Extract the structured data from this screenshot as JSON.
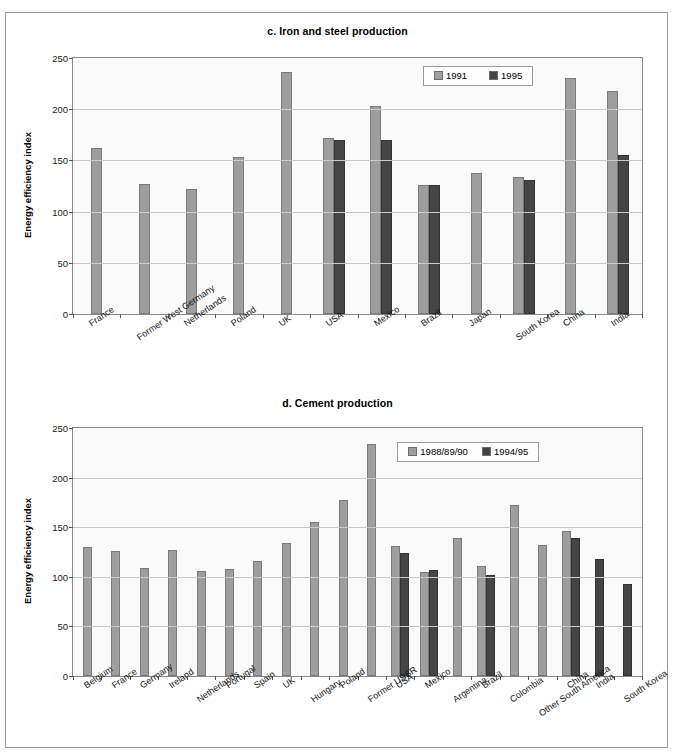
{
  "figure": {
    "axis_label": "Energy efficiency index",
    "yticks": [
      0,
      50,
      100,
      150,
      200,
      250
    ]
  },
  "chart_data": [
    {
      "id": "c",
      "type": "bar",
      "title": "c. Iron and steel production",
      "xlabel": "",
      "ylabel": "Energy efficiency index",
      "ylim": [
        0,
        250
      ],
      "grid": true,
      "legend_position": "upper-right-inside",
      "categories": [
        "France",
        "Former West Germany",
        "Netherlands",
        "Poland",
        "UK",
        "USA",
        "Mexico",
        "Brazil",
        "Japan",
        "South Korea",
        "China",
        "India"
      ],
      "series": [
        {
          "name": "1991",
          "color": "#9e9e9e",
          "values": [
            162,
            127,
            122,
            153,
            236,
            172,
            203,
            126,
            138,
            134,
            230,
            218
          ]
        },
        {
          "name": "1995",
          "color": "#454545",
          "values": [
            null,
            null,
            null,
            null,
            null,
            170,
            170,
            126,
            null,
            131,
            null,
            155
          ]
        }
      ]
    },
    {
      "id": "d",
      "type": "bar",
      "title": "d. Cement production",
      "xlabel": "",
      "ylabel": "Energy efficiency index",
      "ylim": [
        0,
        250
      ],
      "grid": true,
      "legend_position": "upper-center-inside",
      "categories": [
        "Belgium",
        "France",
        "Germany",
        "Ireland",
        "Netherlands",
        "Portugal",
        "Spain",
        "UK",
        "Hungary",
        "Poland",
        "Former USSR",
        "USA",
        "Mexico",
        "Argentina",
        "Brazil",
        "Colombia",
        "Other South America",
        "China",
        "India",
        "South Korea"
      ],
      "series": [
        {
          "name": "1988/89/90",
          "color": "#9e9e9e",
          "values": [
            130,
            126,
            109,
            127,
            106,
            108,
            116,
            134,
            155,
            177,
            234,
            131,
            105,
            139,
            111,
            172,
            132,
            146,
            null,
            null
          ]
        },
        {
          "name": "1994/95",
          "color": "#454545",
          "values": [
            null,
            null,
            null,
            null,
            null,
            null,
            null,
            null,
            null,
            null,
            null,
            124,
            107,
            null,
            102,
            null,
            null,
            139,
            118,
            93
          ]
        }
      ]
    }
  ]
}
